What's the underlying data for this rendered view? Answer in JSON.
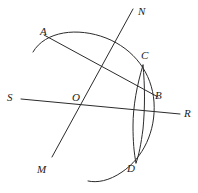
{
  "figure": {
    "kind": "geometry-construction",
    "background_color": "#ffffff",
    "stroke_color": "#2b2b2b",
    "label_color": "#1c1c1c",
    "width": 198,
    "height": 193,
    "labels": [
      {
        "id": "A",
        "text": "A",
        "x": 40,
        "y": 26
      },
      {
        "id": "N",
        "text": "N",
        "x": 138,
        "y": 6
      },
      {
        "id": "C",
        "text": "C",
        "x": 141,
        "y": 50
      },
      {
        "id": "S",
        "text": "S",
        "x": 7,
        "y": 92
      },
      {
        "id": "O",
        "text": "O",
        "x": 72,
        "y": 92
      },
      {
        "id": "B",
        "text": "B",
        "x": 155,
        "y": 90
      },
      {
        "id": "R",
        "text": "R",
        "x": 184,
        "y": 108
      },
      {
        "id": "M",
        "text": "M",
        "x": 37,
        "y": 164
      },
      {
        "id": "D",
        "text": "D",
        "x": 127,
        "y": 163
      }
    ],
    "strokes": [
      {
        "id": "line-N-M",
        "name": "line-nm",
        "type": "line",
        "from": [
          133,
          9
        ],
        "to": [
          52,
          157
        ]
      },
      {
        "id": "line-S-R",
        "name": "line-sr",
        "type": "line",
        "from": [
          21,
          99
        ],
        "to": [
          180,
          114
        ]
      },
      {
        "id": "line-A-B",
        "name": "line-ab",
        "type": "line",
        "from": [
          44,
          35
        ],
        "to": [
          158,
          97
        ]
      },
      {
        "id": "arc-big",
        "name": "arc-major",
        "type": "arc",
        "d": "M 33 52 C 45 31 78 27 106 38 C 134 49 152 73 154 102 C 156 131 143 158 122 172 C 109 181 97 183 88 181"
      },
      {
        "id": "arc-small-CD",
        "name": "arc-cd",
        "type": "arc",
        "d": "M 143 65 C 137 85 133 106 133 126 C 133 141 134 153 136 163"
      },
      {
        "id": "arc-small-CD-2",
        "name": "arc-cd-chord",
        "type": "arc",
        "d": "M 143 65 C 145 86 145 108 143 129 C 141 144 139 155 136 163"
      }
    ]
  }
}
